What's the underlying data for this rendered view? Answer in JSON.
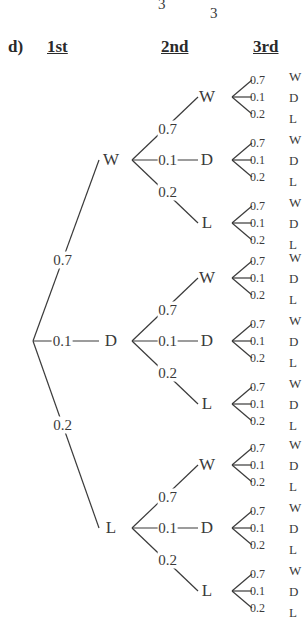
{
  "fragment": {
    "top_left": "3",
    "top_right": "3"
  },
  "header": {
    "part_label": "d)",
    "col1": "1st",
    "col2": "2nd",
    "col3": "3rd"
  },
  "tree": {
    "root": {
      "x": 33,
      "y": 341
    },
    "outcomes": [
      "W",
      "D",
      "L"
    ],
    "probabilities": [
      "0.7",
      "0.1",
      "0.2"
    ],
    "level1": [
      {
        "label": "W",
        "prob": "0.7",
        "x": 107,
        "y": 160
      },
      {
        "label": "D",
        "prob": "0.1",
        "x": 107,
        "y": 341
      },
      {
        "label": "L",
        "prob": "0.2",
        "x": 107,
        "y": 528
      }
    ],
    "level2_offsets": [
      -63,
      0,
      63
    ],
    "level3_offsets": [
      -17,
      0,
      17
    ]
  },
  "chart_data": {
    "type": "tree",
    "title": "d)",
    "levels": [
      "1st",
      "2nd",
      "3rd"
    ],
    "branches": [
      {
        "outcome": "W",
        "probability": 0.7
      },
      {
        "outcome": "D",
        "probability": 0.1
      },
      {
        "outcome": "L",
        "probability": 0.2
      }
    ],
    "depth": 3,
    "leaf_count": 27
  }
}
